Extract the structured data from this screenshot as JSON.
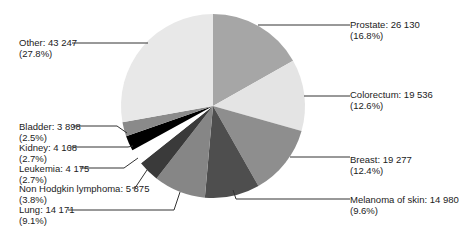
{
  "chart_data": {
    "type": "pie",
    "title": "",
    "start_angle_deg": 0,
    "direction": "clockwise",
    "center": [
      213,
      106
    ],
    "radius": 92,
    "slices": [
      {
        "label": "Prostate",
        "value": 26130,
        "percent": "16.8%",
        "color": "#a6a6a6"
      },
      {
        "label": "Colorectum",
        "value": 19536,
        "percent": "12.6%",
        "color": "#e4e4e4"
      },
      {
        "label": "Breast",
        "value": 19277,
        "percent": "12.4%",
        "color": "#8e8e8e"
      },
      {
        "label": "Melanoma of skin",
        "value": 14980,
        "percent": "9.6%",
        "color": "#4e4e4e"
      },
      {
        "label": "Lung",
        "value": 14171,
        "percent": "9.1%",
        "color": "#868686"
      },
      {
        "label": "Non Hodgkin lymphoma",
        "value": 5875,
        "percent": "3.8%",
        "color": "#3a3a3a"
      },
      {
        "label": "Leukemia",
        "value": 4175,
        "percent": "2.7%",
        "color": "#ffffff"
      },
      {
        "label": "Kidney",
        "value": 4168,
        "percent": "2.7%",
        "color": "#000000"
      },
      {
        "label": "Bladder",
        "value": 3898,
        "percent": "2.5%",
        "color": "#8a8a8a"
      },
      {
        "label": "Other",
        "value": 43247,
        "percent": "27.8%",
        "color": "#e8e8e8"
      }
    ]
  },
  "labels": [
    {
      "line1": "Prostate: 26 130",
      "line2": "(16.8%)",
      "x": 350,
      "y": 19,
      "side": "right",
      "lx": 350,
      "ly": 25,
      "px": 258,
      "py": 25,
      "ax": 258,
      "ay": 25
    },
    {
      "line1": "Colorectum: 19 536",
      "line2": "(12.6%)",
      "x": 350,
      "y": 89,
      "side": "right",
      "lx": 350,
      "ly": 96,
      "px": 304,
      "py": 96,
      "ax": 304,
      "ay": 96
    },
    {
      "line1": "Breast: 19 277",
      "line2": "(12.4%)",
      "x": 350,
      "y": 154,
      "side": "right",
      "lx": 350,
      "ly": 157,
      "px": 290,
      "py": 157,
      "ax": 290,
      "ay": 157
    },
    {
      "line1": "Melanoma of skin: 14 980",
      "line2": "(9.6%)",
      "x": 350,
      "y": 194,
      "side": "right",
      "lx": 350,
      "ly": 199,
      "px": 236,
      "py": 199,
      "ax": 233,
      "ay": 190
    },
    {
      "line1": "Lung: 14 171",
      "line2": "(9.1%)",
      "x": 19,
      "y": 204,
      "side": "left",
      "lx": 68,
      "ly": 210,
      "px": 174,
      "py": 210,
      "ax": 180,
      "ay": 192
    },
    {
      "line1": "Non Hodgkin lymphoma: 5 875",
      "line2": "(3.8%)",
      "x": 19,
      "y": 183,
      "side": "left",
      "lx": 132,
      "ly": 188,
      "px": 135,
      "py": 188,
      "ax": 147,
      "ay": 170
    },
    {
      "line1": "Leukemia: 4 175",
      "line2": "(2.7%)",
      "x": 19,
      "y": 163,
      "side": "left",
      "lx": 80,
      "ly": 168,
      "px": 124,
      "py": 168,
      "ax": 138,
      "ay": 158
    },
    {
      "line1": "Kidney: 4 168",
      "line2": "(2.7%)",
      "x": 19,
      "y": 142,
      "side": "left",
      "lx": 70,
      "ly": 147,
      "px": 128,
      "py": 147,
      "ax": 133,
      "ay": 146
    },
    {
      "line1": "Bladder: 3 898",
      "line2": "(2.5%)",
      "x": 19,
      "y": 121,
      "side": "left",
      "lx": 73,
      "ly": 126,
      "px": 117,
      "py": 126,
      "ax": 127,
      "ay": 133
    },
    {
      "line1": "Other: 43 247",
      "line2": "(27.8%)",
      "x": 19,
      "y": 37,
      "side": "left",
      "lx": 72,
      "ly": 43,
      "px": 148,
      "py": 43,
      "ax": 148,
      "ay": 43
    }
  ]
}
